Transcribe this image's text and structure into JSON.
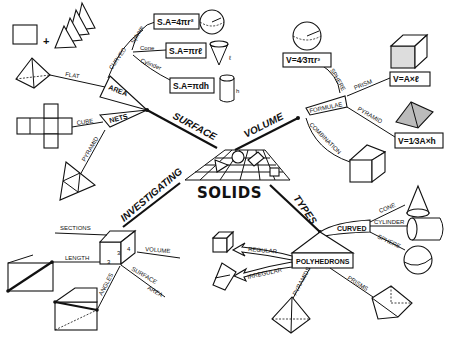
{
  "center": {
    "title": "SOLIDS"
  },
  "branches": {
    "surface": {
      "label": "SURFACE",
      "nodes": {
        "area": {
          "label": "AREA",
          "flat": "FLAT",
          "curved": {
            "label": "CURVED",
            "sphere": {
              "label": "Sphere",
              "formula": "S.A=4πr²"
            },
            "cone": {
              "label": "Cone",
              "formula": "S.A=πrℓ"
            },
            "cylinder": {
              "label": "Cylinder",
              "formula": "S.A=πdh"
            }
          }
        },
        "nets": {
          "label": "NETS",
          "cube": "CUBE",
          "pyramid": "PYRAMID"
        }
      },
      "dim_labels": {
        "r": "r",
        "l": "ℓ",
        "h": "h"
      }
    },
    "volume": {
      "label": "VOLUME",
      "nodes": {
        "formulae": {
          "label": "FORMULAE",
          "sphere": {
            "label": "SPHERE",
            "formula": "V=4⁄3πr³"
          },
          "prism": {
            "label": "PRISM",
            "formula": "V=A×ℓ"
          },
          "pyramid": {
            "label": "PYRAMID",
            "formula": "V=1⁄3A×h"
          }
        },
        "combination": "COMBINATION"
      }
    },
    "investigating": {
      "label": "INVESTIGATING",
      "items": [
        "SECTIONS",
        "LENGTH",
        "VOLUME",
        "SURFACE",
        "AREA",
        "ANGLES"
      ],
      "cube_dims": [
        "3",
        "3",
        "4"
      ]
    },
    "types": {
      "label": "TYPES",
      "curved": {
        "label": "CURVED",
        "items": [
          "CONE",
          "CYLINDER",
          "SPHERE"
        ]
      },
      "polyhedrons": {
        "label": "POLYHEDRONS",
        "items": [
          "REGULAR",
          "IRREGULAR",
          "PYRAMIDS",
          "PRISMS"
        ]
      }
    }
  }
}
